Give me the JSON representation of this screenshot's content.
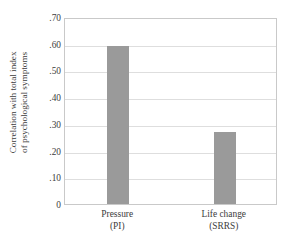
{
  "chart_data": {
    "type": "bar",
    "title": "",
    "xlabel": "",
    "ylabel": "Correlation with total index of psychological symptoms",
    "ylabel_lines": [
      "Correlation with total index",
      "of psychological symptoms"
    ],
    "categories": [
      "Pressure (PI)",
      "Life change (SRRS)"
    ],
    "category_lines": [
      [
        "Pressure",
        "(PI)"
      ],
      [
        "Life change",
        "(SRRS)"
      ]
    ],
    "values": [
      0.59,
      0.27
    ],
    "ylim": [
      0,
      0.7
    ],
    "ytick_values": [
      0.7,
      0.6,
      0.5,
      0.4,
      0.3,
      0.2,
      0.1,
      0
    ],
    "ytick_labels": [
      ".70",
      ".60",
      ".50",
      ".40",
      ".30",
      ".20",
      ".10",
      "0"
    ],
    "grid": true,
    "grid_orientation": "horizontal",
    "legend": false,
    "legend_position": "none",
    "bar_color": "#9a9a9a",
    "plot_border_color": "#c9c9c9",
    "gridline_color": "#dedede",
    "background_color": "#ffffff",
    "text_color": "#3c3c3c"
  }
}
